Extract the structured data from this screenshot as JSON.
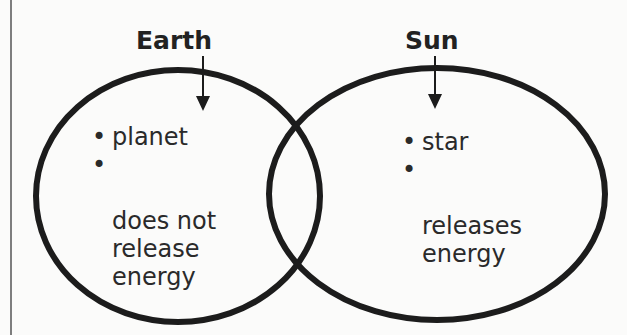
{
  "diagram": {
    "type": "venn",
    "stroke_color": "#1c1c1c",
    "background_color": "#fbfbfa",
    "sets": [
      {
        "label": "Earth",
        "items": [
          "planet",
          "does not\nrelease\nenergy"
        ]
      },
      {
        "label": "Sun",
        "items": [
          "star",
          "releases\nenergy"
        ]
      }
    ],
    "overlap_items": [],
    "bullet": "•"
  }
}
